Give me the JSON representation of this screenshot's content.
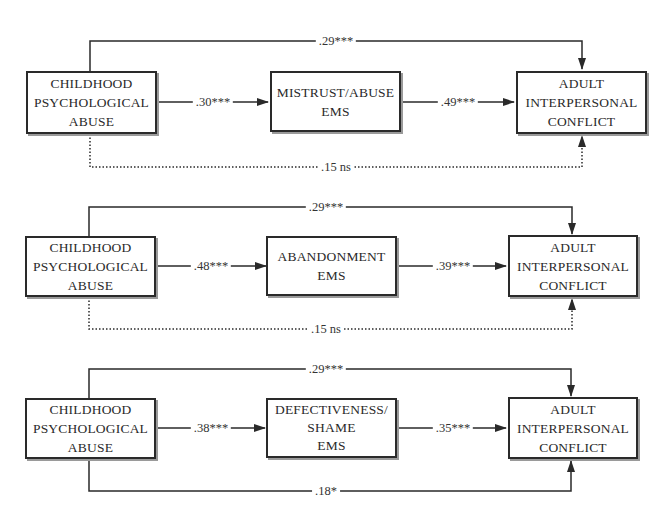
{
  "figure": {
    "panels": [
      {
        "id": "mistrust",
        "predictor": [
          "CHILDHOOD",
          "PSYCHOLOGICAL",
          "ABUSE"
        ],
        "mediator": [
          "MISTRUST/ABUSE",
          "EMS"
        ],
        "outcome": [
          "ADULT",
          "INTERPERSONAL",
          "CONFLICT"
        ],
        "path_a": ".30***",
        "path_b": ".49***",
        "total_effect": ".29***",
        "direct_effect": ".15 ns",
        "direct_effect_style": "dotted"
      },
      {
        "id": "abandonment",
        "predictor": [
          "CHILDHOOD",
          "PSYCHOLOGICAL",
          "ABUSE"
        ],
        "mediator": [
          "ABANDONMENT",
          "EMS"
        ],
        "outcome": [
          "ADULT",
          "INTERPERSONAL",
          "CONFLICT"
        ],
        "path_a": ".48***",
        "path_b": ".39***",
        "total_effect": ".29***",
        "direct_effect": ".15 ns",
        "direct_effect_style": "dotted"
      },
      {
        "id": "defectiveness",
        "predictor": [
          "CHILDHOOD",
          "PSYCHOLOGICAL",
          "ABUSE"
        ],
        "mediator": [
          "DEFECTIVENESS/",
          "SHAME",
          "EMS"
        ],
        "outcome": [
          "ADULT",
          "INTERPERSONAL",
          "CONFLICT"
        ],
        "path_a": ".38***",
        "path_b": ".35***",
        "total_effect": ".29***",
        "direct_effect": ".18*",
        "direct_effect_style": "solid"
      }
    ]
  }
}
